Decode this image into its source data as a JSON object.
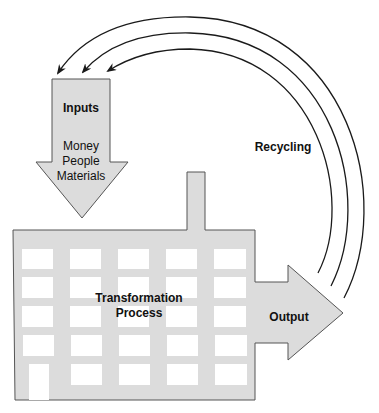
{
  "diagram": {
    "inputs": {
      "title": "Inputs",
      "items": [
        "Money",
        "People",
        "Materials"
      ]
    },
    "process": {
      "line1": "Transformation",
      "line2": "Process"
    },
    "output": {
      "label": "Output"
    },
    "recycling": {
      "label": "Recycling",
      "arc_count": 3
    }
  },
  "colors": {
    "fill": "#dcdcdc",
    "stroke": "#555555",
    "window": "#ffffff",
    "arc": "#1a1a1a",
    "background": "#ffffff"
  }
}
